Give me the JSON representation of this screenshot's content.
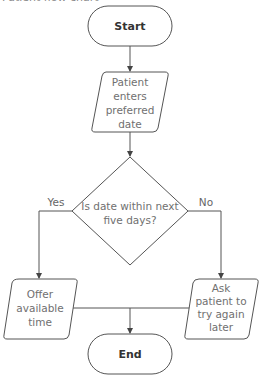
{
  "title": "Patient flow chart",
  "nodes": {
    "start": {
      "label": "Start",
      "type": "terminator"
    },
    "input": {
      "lines": [
        "Patient",
        "enters",
        "preferred",
        "date"
      ],
      "type": "data"
    },
    "decision": {
      "lines": [
        "Is date within next",
        "five days?"
      ],
      "type": "decision"
    },
    "offer": {
      "lines": [
        "Offer",
        "available",
        "time"
      ],
      "type": "data"
    },
    "ask": {
      "lines": [
        "Ask",
        "patient to",
        "try again",
        "later"
      ],
      "type": "data"
    },
    "end": {
      "label": "End",
      "type": "terminator"
    }
  },
  "edges": {
    "yes_label": "Yes",
    "no_label": "No"
  },
  "colors": {
    "stroke": "#555555",
    "text": "#707070",
    "background": "#ffffff"
  }
}
